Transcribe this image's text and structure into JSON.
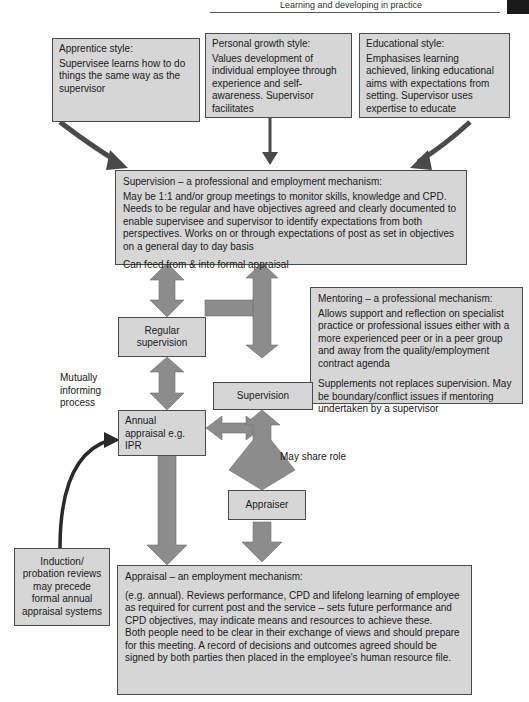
{
  "header": {
    "running_head": "Learning and developing in practice",
    "corner_tab_color": "#1a1a1a"
  },
  "colors": {
    "box_fill": "#d6d6d6",
    "box_border": "#4a4a4a",
    "arrow_fill": "#8c8c8c",
    "arrow_dark": "#4a4a4a",
    "text": "#1a1a1a"
  },
  "styles": {
    "apprentice": {
      "title": "Apprentice style:",
      "body": "Supervisee learns how to do things the same way as the supervisor"
    },
    "personal_growth": {
      "title": "Personal growth style:",
      "body": "Values development of individual employee through experience and self-awareness. Supervisor facilitates"
    },
    "educational": {
      "title": "Educational style:",
      "body": "Emphasises learning achieved, linking educational aims with expectations from setting. Supervisor uses expertise to educate"
    }
  },
  "supervision_box": {
    "title": "Supervision – a professional and employment mechanism:",
    "body": "May be 1:1 and/or group meetings to monitor skills, knowledge and CPD. Needs to be regular and have objectives agreed and clearly documented to enable supervisee and supervisor to identify expectations from both perspectives. Works on or through expectations of post as set in objectives on a general day to day basis",
    "footer": "Can feed from & into formal appraisal"
  },
  "mentoring_box": {
    "title": "Mentoring – a professional mechanism:",
    "body": "Allows support and reflection on specialist practice or professional issues either with a more experienced peer or in a peer group and away from the quality/employment contract agenda",
    "footer": "Supplements not replaces supervision. May be boundary/conflict issues if mentoring undertaken by a supervisor"
  },
  "nodes": {
    "regular_supervision": "Regular supervision",
    "supervision": "Supervision",
    "annual_appraisal": "Annual appraisal e.g. IPR",
    "appraiser": "Appraiser",
    "induction": "Induction/ probation reviews may precede formal annual appraisal systems"
  },
  "labels": {
    "mutually_informing": "Mutually informing process",
    "may_share_role": "May share role"
  },
  "appraisal_box": {
    "title": "Appraisal – an employment mechanism:",
    "body1": "(e.g. annual). Reviews performance, CPD and lifelong learning of employee as required for current post and the service – sets future performance and CPD objectives, may indicate means and resources to achieve these.",
    "body2": "Both people need to be clear in their exchange of views and should prepare for this meeting. A record of decisions and outcomes agreed should be signed by both parties then placed in the employee's human resource file."
  }
}
